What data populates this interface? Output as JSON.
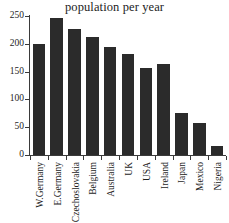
{
  "chart_data": {
    "type": "bar",
    "title": "population per year",
    "xlabel": "",
    "ylabel": "",
    "ylim": [
      0,
      250
    ],
    "yticks": [
      0,
      50,
      100,
      150,
      200,
      250
    ],
    "grid": false,
    "legend": false,
    "bar_color": "#2b2b2b",
    "axis_color": "#3a3a3a",
    "background": "#ffffff",
    "categories": [
      "W.Germany",
      "E.Germany",
      "Czechoslovakia",
      "Belgium",
      "Australia",
      "UK",
      "USA",
      "Ireland",
      "Japan",
      "Mexico",
      "Nigeria"
    ],
    "values": [
      199,
      247,
      227,
      212,
      195,
      181,
      156,
      164,
      75,
      57,
      16
    ]
  }
}
